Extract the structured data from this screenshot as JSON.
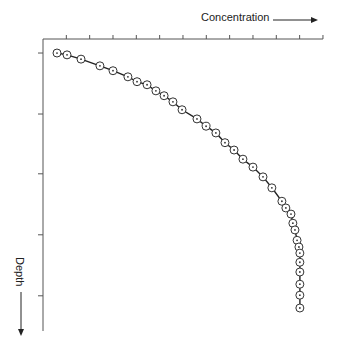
{
  "chart_data": {
    "type": "line",
    "title": "",
    "xlabel": "Concentration",
    "ylabel": "Depth",
    "x_axis_position": "top",
    "y_axis_direction": "down",
    "x_ticks": [
      0,
      1,
      2,
      3,
      4,
      5,
      6,
      7,
      8,
      9,
      10,
      11,
      12
    ],
    "y_ticks": [
      0.23,
      1.23,
      2.21,
      3.21,
      4.21
    ],
    "xlim": [
      0,
      12
    ],
    "ylim": [
      0,
      4.8
    ],
    "grid": false,
    "legend": null,
    "tick_labels_shown": false,
    "marker": "circle-with-center-dot",
    "series": [
      {
        "name": "profile",
        "points": [
          [
            0.6,
            0.23
          ],
          [
            1.03,
            0.26
          ],
          [
            1.63,
            0.33
          ],
          [
            2.44,
            0.44
          ],
          [
            3.0,
            0.52
          ],
          [
            3.64,
            0.62
          ],
          [
            4.03,
            0.7
          ],
          [
            4.46,
            0.75
          ],
          [
            4.84,
            0.85
          ],
          [
            5.19,
            0.93
          ],
          [
            5.57,
            1.03
          ],
          [
            5.96,
            1.16
          ],
          [
            6.6,
            1.31
          ],
          [
            6.99,
            1.43
          ],
          [
            7.41,
            1.54
          ],
          [
            7.8,
            1.7
          ],
          [
            8.19,
            1.82
          ],
          [
            8.57,
            1.97
          ],
          [
            9.0,
            2.1
          ],
          [
            9.43,
            2.26
          ],
          [
            9.81,
            2.44
          ],
          [
            10.24,
            2.66
          ],
          [
            10.41,
            2.77
          ],
          [
            10.63,
            2.87
          ],
          [
            10.71,
            3.02
          ],
          [
            10.8,
            3.13
          ],
          [
            10.89,
            3.3
          ],
          [
            10.97,
            3.41
          ],
          [
            11.01,
            3.51
          ],
          [
            11.01,
            3.66
          ],
          [
            11.01,
            3.82
          ],
          [
            11.01,
            4.02
          ],
          [
            11.01,
            4.2
          ],
          [
            11.01,
            4.41
          ]
        ]
      }
    ]
  },
  "labels": {
    "x_axis": "Concentration",
    "y_axis": "Depth"
  },
  "colors": {
    "axis": "#555555",
    "line": "#222222",
    "marker_stroke": "#333333",
    "marker_fill": "#ffffff",
    "text": "#222222"
  }
}
